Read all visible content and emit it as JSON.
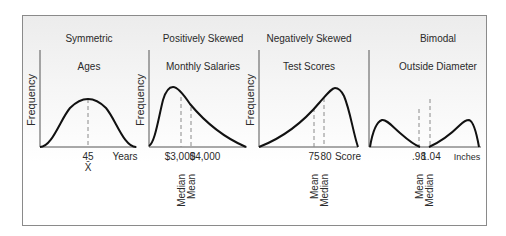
{
  "figure": {
    "panels": [
      {
        "type_label": "Symmetric",
        "subject": "Ages",
        "y_axis_label": "Frequency",
        "x_unit": "Years",
        "ticks": [
          "45"
        ],
        "tick_sub": "X̄",
        "marker_labels": []
      },
      {
        "type_label": "Positively Skewed",
        "subject": "Monthly Salaries",
        "y_axis_label": "Frequency",
        "x_unit": "",
        "ticks": [
          "$3,000",
          "$4,000"
        ],
        "marker_labels": [
          "Median",
          "Mean"
        ]
      },
      {
        "type_label": "Negatively Skewed",
        "subject": "Test Scores",
        "y_axis_label": "Frequency",
        "x_unit": "Score",
        "ticks": [
          "75",
          "80"
        ],
        "marker_labels": [
          "Mean",
          "Median"
        ]
      },
      {
        "type_label": "Bimodal",
        "subject": "Outside Diameter",
        "y_axis_label": "",
        "x_unit": "Inches",
        "ticks": [
          ".98",
          "1.04"
        ],
        "marker_labels": [
          "Mean",
          "Median"
        ]
      }
    ],
    "colors": {
      "curve": "#111111",
      "axis": "#555555",
      "dashed": "#8a8a8a",
      "text": "#2a2a2a",
      "border": "#8a8a8a"
    }
  }
}
